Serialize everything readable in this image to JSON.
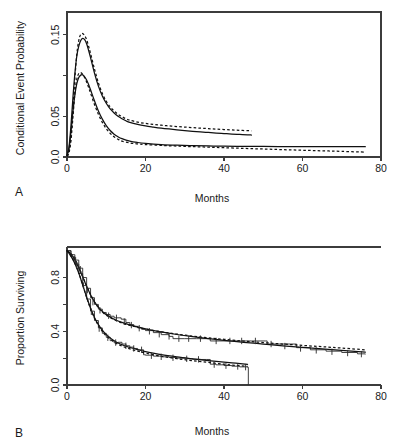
{
  "figure": {
    "panel_labels": [
      "A",
      "B"
    ],
    "background_color": "#ffffff",
    "line_color": "#111111"
  },
  "chart_data": [
    {
      "panel": "A",
      "type": "line",
      "title": "",
      "xlabel": "Months",
      "ylabel": "Conditional Event Probability",
      "xlim": [
        0,
        80
      ],
      "ylim": [
        0,
        0.178
      ],
      "xticks": [
        0,
        20,
        40,
        60,
        80
      ],
      "xticklabels": [
        "0",
        "20",
        "40",
        "60",
        "80"
      ],
      "yticks": [
        0.0,
        0.05,
        0.1,
        0.15
      ],
      "yticklabels": [
        "0.0",
        "0.05",
        "",
        "0.15"
      ],
      "grid": false,
      "legend": "none",
      "frame": "box",
      "series": [
        {
          "name": "group-1-solid",
          "style": "solid",
          "x": [
            0,
            0.5,
            1,
            1.5,
            2,
            2.5,
            3,
            3.5,
            4,
            4.5,
            5,
            5.5,
            6,
            7,
            8,
            9,
            10,
            11,
            12,
            13,
            14,
            15,
            16,
            18,
            20,
            22,
            24,
            26,
            28,
            30,
            32,
            34,
            36,
            38,
            40,
            42,
            44,
            46,
            47
          ],
          "y": [
            0.002,
            0.012,
            0.038,
            0.072,
            0.102,
            0.124,
            0.136,
            0.143,
            0.1455,
            0.144,
            0.139,
            0.131,
            0.122,
            0.103,
            0.087,
            0.075,
            0.066,
            0.059,
            0.054,
            0.05,
            0.047,
            0.0445,
            0.0425,
            0.04,
            0.0382,
            0.0368,
            0.0355,
            0.0344,
            0.0334,
            0.0325,
            0.0316,
            0.0308,
            0.0301,
            0.0294,
            0.0288,
            0.0282,
            0.0277,
            0.0272,
            0.027
          ]
        },
        {
          "name": "group-1-dashed",
          "style": "dashed",
          "x": [
            0,
            0.5,
            1,
            1.5,
            2,
            2.5,
            3,
            3.5,
            4,
            4.5,
            5,
            5.5,
            6,
            7,
            8,
            9,
            10,
            11,
            12,
            13,
            14,
            15,
            16,
            18,
            20,
            22,
            24,
            26,
            28,
            30,
            32,
            34,
            36,
            38,
            40,
            42,
            44,
            46,
            47
          ],
          "y": [
            0.001,
            0.006,
            0.024,
            0.058,
            0.096,
            0.126,
            0.143,
            0.1505,
            0.1515,
            0.149,
            0.144,
            0.136,
            0.127,
            0.108,
            0.091,
            0.078,
            0.0685,
            0.0615,
            0.0565,
            0.0525,
            0.0495,
            0.047,
            0.0452,
            0.0428,
            0.0412,
            0.04,
            0.039,
            0.0382,
            0.0374,
            0.0367,
            0.036,
            0.0354,
            0.0348,
            0.0342,
            0.0337,
            0.0332,
            0.0327,
            0.0323,
            0.0322
          ]
        },
        {
          "name": "group-2-solid",
          "style": "solid",
          "x": [
            0,
            0.5,
            1,
            1.5,
            2,
            2.5,
            3,
            3.5,
            4,
            4.5,
            5,
            5.5,
            6,
            7,
            8,
            9,
            10,
            11,
            12,
            13,
            14,
            16,
            18,
            20,
            24,
            28,
            32,
            36,
            40,
            45,
            50,
            55,
            60,
            65,
            70,
            76
          ],
          "y": [
            0.002,
            0.01,
            0.03,
            0.055,
            0.076,
            0.09,
            0.0975,
            0.1005,
            0.1008,
            0.0985,
            0.0945,
            0.089,
            0.0825,
            0.069,
            0.0565,
            0.0465,
            0.0385,
            0.0325,
            0.028,
            0.0248,
            0.0225,
            0.0195,
            0.0178,
            0.0167,
            0.0153,
            0.0145,
            0.014,
            0.0136,
            0.0133,
            0.0131,
            0.0129,
            0.0128,
            0.0127,
            0.0127,
            0.0126,
            0.0126
          ]
        },
        {
          "name": "group-2-dashed",
          "style": "dashed",
          "x": [
            0,
            0.5,
            1,
            1.5,
            2,
            2.5,
            3,
            3.5,
            4,
            4.5,
            5,
            5.5,
            6,
            7,
            8,
            9,
            10,
            11,
            12,
            13,
            14,
            16,
            18,
            20,
            24,
            28,
            32,
            36,
            40,
            45,
            50,
            55,
            60,
            65,
            70,
            76
          ],
          "y": [
            0.001,
            0.005,
            0.02,
            0.048,
            0.078,
            0.0955,
            0.1025,
            0.1035,
            0.1015,
            0.0975,
            0.092,
            0.0855,
            0.0785,
            0.0645,
            0.0525,
            0.0425,
            0.0348,
            0.029,
            0.0248,
            0.0218,
            0.0196,
            0.0172,
            0.016,
            0.0152,
            0.0142,
            0.0134,
            0.0127,
            0.0121,
            0.0114,
            0.0106,
            0.0098,
            0.009,
            0.0083,
            0.0076,
            0.0069,
            0.006
          ]
        }
      ]
    },
    {
      "panel": "B",
      "type": "line",
      "title": "",
      "xlabel": "Months",
      "ylabel": "Proportion Surviving",
      "xlim": [
        0,
        80
      ],
      "ylim": [
        0,
        1.02
      ],
      "xticks": [
        0,
        20,
        40,
        60,
        80
      ],
      "xticklabels": [
        "0",
        "20",
        "40",
        "60",
        "80"
      ],
      "yticks": [
        0.0,
        0.2,
        0.4,
        0.6,
        0.8
      ],
      "yticklabels": [
        "0.0",
        "",
        "0.4",
        "",
        "0.8"
      ],
      "grid": false,
      "legend": "none",
      "frame": "bottom-left",
      "series": [
        {
          "name": "upper-km-step",
          "style": "step",
          "x": [
            0,
            1,
            2,
            3,
            4,
            5,
            6,
            7,
            8,
            9,
            10,
            11,
            12,
            13,
            13.8,
            15,
            16,
            17,
            18,
            19,
            20,
            22,
            24,
            26,
            27,
            30,
            33,
            35.5,
            36.5,
            40,
            44,
            47,
            50.5,
            51,
            53.5,
            58.5,
            62,
            66,
            70,
            74,
            76
          ],
          "y": [
            1.0,
            0.97,
            0.93,
            0.87,
            0.8,
            0.72,
            0.65,
            0.6,
            0.565,
            0.54,
            0.525,
            0.512,
            0.5,
            0.5,
            0.49,
            0.465,
            0.45,
            0.437,
            0.425,
            0.415,
            0.405,
            0.39,
            0.375,
            0.362,
            0.345,
            0.345,
            0.345,
            0.345,
            0.328,
            0.328,
            0.328,
            0.328,
            0.328,
            0.305,
            0.305,
            0.278,
            0.262,
            0.252,
            0.242,
            0.232,
            0.228
          ]
        },
        {
          "name": "upper-model-solid",
          "style": "solid",
          "x": [
            0,
            1,
            2,
            3,
            4,
            5,
            6,
            7,
            8,
            9,
            10,
            12,
            14,
            16,
            18,
            20,
            24,
            28,
            32,
            36,
            40,
            45,
            50,
            55,
            60,
            65,
            70,
            76
          ],
          "y": [
            1.0,
            0.975,
            0.932,
            0.872,
            0.805,
            0.735,
            0.672,
            0.62,
            0.58,
            0.548,
            0.524,
            0.49,
            0.466,
            0.447,
            0.432,
            0.418,
            0.395,
            0.376,
            0.36,
            0.346,
            0.333,
            0.318,
            0.305,
            0.292,
            0.28,
            0.269,
            0.258,
            0.245
          ]
        },
        {
          "name": "upper-model-dashed",
          "style": "dashed",
          "x": [
            0,
            1,
            2,
            3,
            4,
            5,
            6,
            7,
            8,
            9,
            10,
            12,
            14,
            16,
            18,
            20,
            24,
            28,
            32,
            36,
            40,
            45,
            50,
            55,
            60,
            65,
            70,
            76
          ],
          "y": [
            1.0,
            0.978,
            0.938,
            0.878,
            0.808,
            0.737,
            0.672,
            0.618,
            0.576,
            0.544,
            0.52,
            0.486,
            0.462,
            0.444,
            0.43,
            0.417,
            0.396,
            0.379,
            0.364,
            0.351,
            0.34,
            0.327,
            0.316,
            0.305,
            0.295,
            0.285,
            0.275,
            0.262
          ]
        },
        {
          "name": "lower-km-step",
          "style": "step",
          "x": [
            0,
            1,
            2,
            3,
            4,
            5,
            6,
            7,
            8,
            9,
            10,
            11,
            12,
            13,
            13.5,
            14,
            15,
            16,
            17,
            18,
            19.5,
            20,
            22,
            24,
            26,
            28,
            30,
            32,
            34,
            35.5,
            36.5,
            38,
            40,
            42,
            44,
            46,
            46.2
          ],
          "y": [
            1.0,
            0.955,
            0.9,
            0.83,
            0.74,
            0.64,
            0.55,
            0.48,
            0.425,
            0.385,
            0.355,
            0.33,
            0.315,
            0.318,
            0.318,
            0.305,
            0.292,
            0.282,
            0.272,
            0.262,
            0.225,
            0.222,
            0.215,
            0.21,
            0.205,
            0.2,
            0.196,
            0.192,
            0.19,
            0.19,
            0.155,
            0.15,
            0.145,
            0.14,
            0.135,
            0.132,
            0.0
          ]
        },
        {
          "name": "lower-model-solid",
          "style": "solid",
          "x": [
            0,
            1,
            2,
            3,
            4,
            5,
            6,
            7,
            8,
            9,
            10,
            12,
            14,
            16,
            18,
            20,
            24,
            28,
            32,
            36,
            40,
            43,
            46
          ],
          "y": [
            1.0,
            0.96,
            0.905,
            0.833,
            0.745,
            0.655,
            0.572,
            0.503,
            0.45,
            0.408,
            0.375,
            0.33,
            0.3,
            0.279,
            0.263,
            0.249,
            0.226,
            0.209,
            0.195,
            0.182,
            0.17,
            0.162,
            0.154
          ]
        },
        {
          "name": "lower-model-dashed",
          "style": "dashed",
          "x": [
            0,
            1,
            2,
            3,
            4,
            5,
            6,
            7,
            8,
            9,
            10,
            12,
            14,
            16,
            18,
            20,
            24,
            28,
            32,
            36,
            40,
            43,
            46
          ],
          "y": [
            1.0,
            0.962,
            0.908,
            0.835,
            0.745,
            0.652,
            0.568,
            0.497,
            0.443,
            0.4,
            0.366,
            0.32,
            0.29,
            0.269,
            0.252,
            0.238,
            0.214,
            0.196,
            0.181,
            0.168,
            0.155,
            0.146,
            0.138
          ]
        }
      ],
      "censor_marks": {
        "upper": [
          [
            2.2,
            0.928
          ],
          [
            3.4,
            0.862
          ],
          [
            5.2,
            0.707
          ],
          [
            6.6,
            0.617
          ],
          [
            8.4,
            0.556
          ],
          [
            10.6,
            0.516
          ],
          [
            12.6,
            0.5
          ],
          [
            14.6,
            0.472
          ],
          [
            16.4,
            0.446
          ],
          [
            18.4,
            0.423
          ],
          [
            21.0,
            0.4
          ],
          [
            23.5,
            0.378
          ],
          [
            26.0,
            0.362
          ],
          [
            28.5,
            0.345
          ],
          [
            31.0,
            0.345
          ],
          [
            34.0,
            0.345
          ],
          [
            38.0,
            0.328
          ],
          [
            41.5,
            0.328
          ],
          [
            44.5,
            0.328
          ],
          [
            48.0,
            0.328
          ],
          [
            52.0,
            0.305
          ],
          [
            55.5,
            0.29
          ],
          [
            59.5,
            0.272
          ],
          [
            63.5,
            0.258
          ],
          [
            67.5,
            0.248
          ],
          [
            71.5,
            0.238
          ],
          [
            75.0,
            0.23
          ]
        ],
        "lower": [
          [
            2.4,
            0.895
          ],
          [
            4.2,
            0.74
          ],
          [
            6.2,
            0.545
          ],
          [
            8.2,
            0.42
          ],
          [
            10.4,
            0.352
          ],
          [
            12.4,
            0.316
          ],
          [
            15.0,
            0.292
          ],
          [
            17.0,
            0.272
          ],
          [
            19.0,
            0.262
          ],
          [
            21.5,
            0.218
          ],
          [
            24.0,
            0.21
          ],
          [
            27.0,
            0.203
          ],
          [
            30.5,
            0.195
          ],
          [
            33.5,
            0.191
          ],
          [
            37.5,
            0.152
          ],
          [
            40.5,
            0.144
          ],
          [
            43.5,
            0.138
          ],
          [
            45.5,
            0.133
          ]
        ]
      }
    }
  ]
}
